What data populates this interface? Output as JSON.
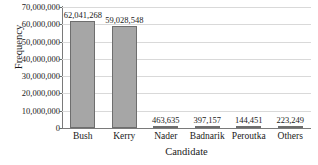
{
  "chart_data": {
    "type": "bar",
    "title": "",
    "xlabel": "Candidate",
    "ylabel": "Frequency",
    "categories": [
      "Bush",
      "Kerry",
      "Nader",
      "Badnarik",
      "Peroutka",
      "Others"
    ],
    "values": [
      62041268,
      59028548,
      463635,
      397157,
      144451,
      223249
    ],
    "value_labels": [
      "62,041,268",
      "59,028,548",
      "463,635",
      "397,157",
      "144,451",
      "223,249"
    ],
    "ylim": [
      0,
      70000000
    ],
    "ytick_values": [
      0,
      10000000,
      20000000,
      30000000,
      40000000,
      50000000,
      60000000,
      70000000
    ],
    "ytick_labels": [
      "0",
      "10,000,000",
      "20,000,000",
      "30,000,000",
      "40,000,000",
      "50,000,000",
      "60,000,000",
      "70,000,000"
    ],
    "grid": true,
    "legend": false,
    "bar_color": "#a6a6a6",
    "bar_border_color": "#6e6e6e",
    "gridline_color": "#d9d9d9",
    "axis_color": "#7a7a7a",
    "background_color": "#ffffff"
  }
}
